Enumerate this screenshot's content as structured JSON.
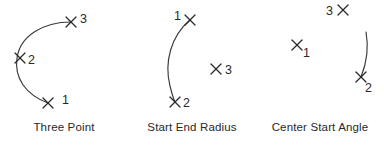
{
  "figure": {
    "background_color": "#ffffff",
    "stroke_color": "#3a3a3c",
    "text_color": "#28282b",
    "panels": [
      {
        "id": "three-point",
        "caption": "Three Point",
        "points": [
          {
            "label": "1",
            "mark_x": 48,
            "mark_y": 103,
            "label_x": 62,
            "label_y": 100
          },
          {
            "label": "2",
            "mark_x": 20,
            "mark_y": 58,
            "label_x": 31,
            "label_y": 62
          },
          {
            "label": "3",
            "mark_x": 71,
            "mark_y": 22,
            "label_x": 83,
            "label_y": 20
          }
        ],
        "arc": "M 48 103 C 26 95 14 78 17 58 C 20 36 43 22 71 22"
      },
      {
        "id": "start-end-radius",
        "caption": "Start End Radius",
        "points": [
          {
            "label": "1",
            "mark_x": 62,
            "mark_y": 20,
            "label_x": 50,
            "label_y": 17
          },
          {
            "label": "2",
            "mark_x": 47,
            "mark_y": 102,
            "label_x": 58,
            "label_y": 106
          },
          {
            "label": "3",
            "mark_x": 88,
            "mark_y": 69,
            "label_x": 100,
            "label_y": 73
          }
        ],
        "arc": "M 62 20 C 43 36 36 62 42 86 C 44 94 45 98 47 102"
      },
      {
        "id": "center-start-angle",
        "caption": "Center Start Angle",
        "points": [
          {
            "label": "1",
            "mark_x": 41,
            "mark_y": 45,
            "label_x": 50,
            "label_y": 54
          },
          {
            "label": "2",
            "mark_x": 105,
            "mark_y": 77,
            "label_x": 112,
            "label_y": 88
          },
          {
            "label": "3",
            "mark_x": 87,
            "mark_y": 10,
            "label_x": 74,
            "label_y": 14
          }
        ],
        "arc": "M 110 32 C 113 48 111 62 105 77"
      }
    ]
  }
}
